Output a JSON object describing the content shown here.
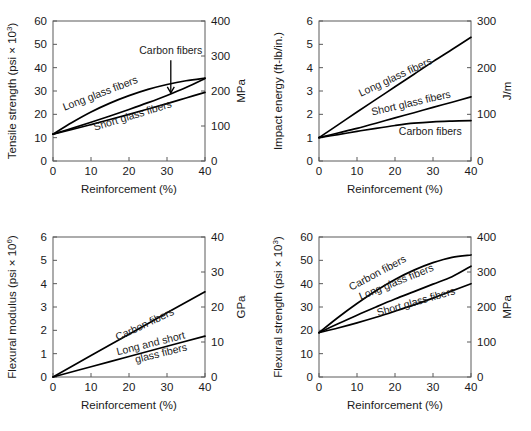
{
  "figure": {
    "title": "",
    "panel_count": 4
  },
  "chart_data": [
    {
      "id": "tensile-strength",
      "type": "line",
      "title": "",
      "xlabel": "Reinforcement (%)",
      "ylabel": "Tensile strength (psi × 10",
      "ylabel_sup": "3",
      "ylabel_tail": ")",
      "ylabel_right": "MPa",
      "xlim": [
        0,
        40
      ],
      "ylim": [
        0,
        60
      ],
      "ylim_right": [
        0,
        400
      ],
      "xticks": [
        0,
        10,
        20,
        30,
        40
      ],
      "yticks": [
        0,
        10,
        20,
        30,
        40,
        50,
        60
      ],
      "yticks_right": [
        0,
        100,
        200,
        300,
        400
      ],
      "grid": false,
      "legend_position": "inline-labels",
      "x": [
        0,
        5,
        10,
        15,
        20,
        25,
        30,
        35,
        40
      ],
      "series": [
        {
          "name": "Long glass fibers",
          "label": "Long glass fibers",
          "values": [
            11.5,
            16.5,
            21.0,
            24.8,
            28.0,
            30.7,
            32.8,
            34.4,
            35.5
          ]
        },
        {
          "name": "Carbon fibers",
          "label": "Carbon fibers",
          "values": [
            11.5,
            14.0,
            16.6,
            19.3,
            22.1,
            25.0,
            28.1,
            31.5,
            35.4
          ]
        },
        {
          "name": "Short glass fibers",
          "label": "Short glass fibers",
          "values": [
            11.5,
            13.5,
            15.6,
            17.8,
            20.0,
            22.3,
            24.6,
            27.0,
            29.4
          ]
        }
      ],
      "annotations": [
        {
          "text": "Carbon fibers",
          "points_to_x": 31,
          "points_to_y": 29.2
        }
      ]
    },
    {
      "id": "impact-energy",
      "type": "line",
      "title": "",
      "xlabel": "Reinforcement (%)",
      "ylabel": "Impact energy (ft-lb/in.)",
      "ylabel_right": "J/m",
      "xlim": [
        0,
        40
      ],
      "ylim": [
        0,
        6
      ],
      "ylim_right": [
        0,
        300
      ],
      "xticks": [
        0,
        10,
        20,
        30,
        40
      ],
      "yticks": [
        0,
        1,
        2,
        3,
        4,
        5,
        6
      ],
      "yticks_right": [
        0,
        100,
        200,
        300
      ],
      "grid": false,
      "legend_position": "inline-labels",
      "x": [
        0,
        5,
        10,
        15,
        20,
        25,
        30,
        35,
        40
      ],
      "series": [
        {
          "name": "Long glass fibers",
          "label": "Long glass fibers",
          "values": [
            1.0,
            1.55,
            2.1,
            2.64,
            3.18,
            3.72,
            4.26,
            4.78,
            5.3
          ]
        },
        {
          "name": "Short glass fibers",
          "label": "Short glass fibers",
          "values": [
            1.0,
            1.2,
            1.4,
            1.62,
            1.85,
            2.07,
            2.3,
            2.52,
            2.75
          ]
        },
        {
          "name": "Carbon fibers",
          "label": "Carbon fibers",
          "values": [
            1.0,
            1.13,
            1.27,
            1.4,
            1.52,
            1.62,
            1.68,
            1.71,
            1.73
          ]
        }
      ],
      "annotations": []
    },
    {
      "id": "flexural-modulus",
      "type": "line",
      "title": "",
      "xlabel": "Reinforcement (%)",
      "ylabel": "Flexural modulus (psi × 10",
      "ylabel_sup": "6",
      "ylabel_tail": ")",
      "ylabel_right": "GPa",
      "xlim": [
        0,
        40
      ],
      "ylim": [
        0,
        6
      ],
      "ylim_right": [
        0,
        40
      ],
      "xticks": [
        0,
        10,
        20,
        30,
        40
      ],
      "yticks": [
        0,
        1,
        2,
        3,
        4,
        5,
        6
      ],
      "yticks_right": [
        0,
        10,
        20,
        30,
        40
      ],
      "grid": false,
      "legend_position": "inline-labels",
      "x": [
        0,
        10,
        20,
        30,
        40
      ],
      "series": [
        {
          "name": "Carbon fibers",
          "label": "Carbon fibers",
          "values": [
            0.0,
            0.92,
            1.83,
            2.75,
            3.65
          ]
        },
        {
          "name": "Long and short glass fibers",
          "label": "Long and short glass fibers",
          "values": [
            0.0,
            0.44,
            0.88,
            1.32,
            1.75
          ]
        }
      ],
      "annotations": []
    },
    {
      "id": "flexural-strength",
      "type": "line",
      "title": "",
      "xlabel": "Reinforcement (%)",
      "ylabel": "Flexural strength (psi × 10",
      "ylabel_sup": "3",
      "ylabel_tail": ")",
      "ylabel_right": "MPa",
      "xlim": [
        0,
        40
      ],
      "ylim": [
        0,
        60
      ],
      "ylim_right": [
        0,
        400
      ],
      "xticks": [
        0,
        10,
        20,
        30,
        40
      ],
      "yticks": [
        0,
        10,
        20,
        30,
        40,
        50,
        60
      ],
      "yticks_right": [
        0,
        100,
        200,
        300,
        400
      ],
      "grid": false,
      "legend_position": "inline-labels",
      "x": [
        0,
        5,
        10,
        15,
        20,
        25,
        30,
        35,
        40
      ],
      "series": [
        {
          "name": "Carbon fibers",
          "label": "Carbon fibers",
          "values": [
            19.0,
            25.5,
            31.5,
            37.0,
            41.8,
            45.8,
            49.0,
            51.3,
            52.3
          ]
        },
        {
          "name": "Long glass fibers",
          "label": "Long glass fibers",
          "values": [
            19.0,
            22.8,
            26.5,
            30.0,
            33.4,
            36.6,
            39.8,
            43.0,
            47.5
          ]
        },
        {
          "name": "Short glass fibers",
          "label": "Short glass fibers",
          "values": [
            19.0,
            21.0,
            23.2,
            25.6,
            28.2,
            30.9,
            33.8,
            36.9,
            40.0
          ]
        }
      ],
      "annotations": []
    }
  ]
}
